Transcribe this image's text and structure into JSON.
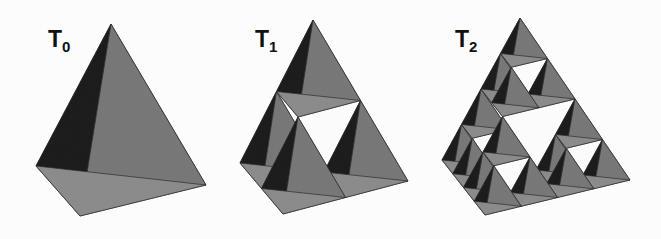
{
  "figure": {
    "background_color": "#fefefe",
    "ink_color": "#111111"
  },
  "palette": {
    "face_left_dark": "#191919",
    "face_right_mid": "#767676",
    "face_bottom_light": "#8a8a8a",
    "face_inner_shadow": "#2b2b2b",
    "hole_white": "#fdfdfd",
    "edge_line": "#2a2a2a"
  },
  "panels": [
    {
      "id": "T0",
      "label_text": "T",
      "label_sub": "0",
      "label_x": 48,
      "label_y": 28,
      "depth": 0,
      "apex": {
        "x": 111,
        "y": 24
      },
      "left": {
        "x": 36,
        "y": 166
      },
      "right": {
        "x": 206,
        "y": 185
      },
      "front": {
        "x": 80,
        "y": 216
      }
    },
    {
      "id": "T1",
      "label_text": "T",
      "label_sub": "1",
      "label_x": 255,
      "label_y": 28,
      "depth": 1,
      "apex": {
        "x": 313,
        "y": 20
      },
      "left": {
        "x": 240,
        "y": 163
      },
      "right": {
        "x": 408,
        "y": 181
      },
      "front": {
        "x": 283,
        "y": 214
      }
    },
    {
      "id": "T2",
      "label_text": "T",
      "label_sub": "2",
      "label_x": 455,
      "label_y": 28,
      "depth": 2,
      "apex": {
        "x": 520,
        "y": 18
      },
      "left": {
        "x": 442,
        "y": 160
      },
      "right": {
        "x": 630,
        "y": 180
      },
      "front": {
        "x": 485,
        "y": 215
      }
    }
  ],
  "chart_data": {
    "type": "diagram",
    "iterations": [
      {
        "label": "T0",
        "level": 0,
        "sub_tetrahedra": 1,
        "holes": 0
      },
      {
        "label": "T1",
        "level": 1,
        "sub_tetrahedra": 4,
        "holes": 1
      },
      {
        "label": "T2",
        "level": 2,
        "sub_tetrahedra": 16,
        "holes": 5
      }
    ],
    "rule": "Each tetrahedron is replaced by 4 half-scale tetrahedra at its corners, leaving an octahedral void."
  }
}
